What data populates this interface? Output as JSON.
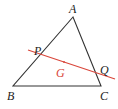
{
  "diagram": {
    "colors": {
      "triangle": "#333333",
      "line": "#d9473b",
      "label": "#222222",
      "centroid_label": "#d9473b",
      "background": "#ffffff"
    },
    "points": {
      "A": {
        "label": "A",
        "x": 73,
        "y": 17
      },
      "B": {
        "label": "B",
        "x": 13,
        "y": 86
      },
      "C": {
        "label": "C",
        "x": 101,
        "y": 86
      },
      "P": {
        "label": "P",
        "x": 38,
        "y": 55
      },
      "Q": {
        "label": "Q",
        "x": 99,
        "y": 74
      },
      "G": {
        "label": "G",
        "x": 63,
        "y": 63
      }
    },
    "labels": {
      "A": "A",
      "B": "B",
      "C": "C",
      "P": "P",
      "Q": "Q",
      "G": "G"
    },
    "red_line": {
      "x1": 28,
      "y1": 50,
      "x2": 115,
      "y2": 79
    }
  }
}
